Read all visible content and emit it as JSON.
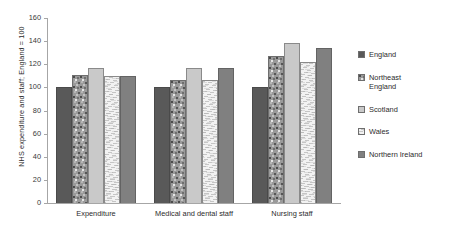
{
  "chart_data": {
    "type": "bar",
    "title": "",
    "subtitle": "",
    "xlabel": "",
    "ylabel": "NHS expenditure and staff; England = 100",
    "ylim": [
      0,
      160
    ],
    "ytick_step": 20,
    "ytick_labels": [
      "160",
      "140",
      "120",
      "100",
      "80",
      "60",
      "40",
      "20",
      "0"
    ],
    "grid": false,
    "legend_position": "right",
    "categories": [
      "Expenditure",
      "Medical and dental staff",
      "Nursing staff"
    ],
    "series": [
      {
        "name": "England",
        "values": [
          100,
          100,
          100
        ],
        "color": "#595959",
        "pattern": "solid-dark"
      },
      {
        "name": "Northeast England",
        "values": [
          111,
          106,
          127
        ],
        "color": "#9a9a9a",
        "pattern": "speckle"
      },
      {
        "name": "Scotland",
        "values": [
          117,
          117,
          138
        ],
        "color": "#c9c9c9",
        "pattern": "solid-light"
      },
      {
        "name": "Wales",
        "values": [
          110,
          106,
          122
        ],
        "color": "#f2f2f2",
        "pattern": "fine-texture"
      },
      {
        "name": "Northern Ireland",
        "values": [
          110,
          117,
          134
        ],
        "color": "#808080",
        "pattern": "solid-medium"
      }
    ]
  },
  "legend": {
    "items": [
      {
        "label": "England"
      },
      {
        "label": "Northeast\nEngland"
      },
      {
        "label": "Scotland"
      },
      {
        "label": "Wales"
      },
      {
        "label": "Northern Ireland"
      }
    ]
  }
}
